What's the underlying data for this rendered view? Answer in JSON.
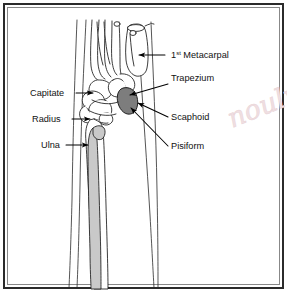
{
  "figure": {
    "border_color": "#2b2b2b",
    "background_color": "#ffffff"
  },
  "watermark": {
    "text": "nouly",
    "color": "#f0dfe2",
    "note": "faint handwritten watermark, partially cropped at right edge"
  },
  "labels": {
    "metacarpal": {
      "text": "1",
      "sup": "st",
      "rest": " Metacarpal"
    },
    "trapezium": "Trapezium",
    "scaphoid": "Scaphoid",
    "pisiform": "Pisiform",
    "capitate": "Capitate",
    "radius": "Radius",
    "ulna": "Ulna"
  },
  "anatomy": {
    "shaded_bones": [
      {
        "name": "ulna",
        "shade": "#c9c9c9"
      },
      {
        "name": "scaphoid",
        "shade": "#7d7d7d"
      }
    ],
    "label_side": {
      "left": [
        "Capitate",
        "Radius",
        "Ulna"
      ],
      "right": [
        "1st Metacarpal",
        "Trapezium",
        "Scaphoid",
        "Pisiform"
      ]
    }
  }
}
